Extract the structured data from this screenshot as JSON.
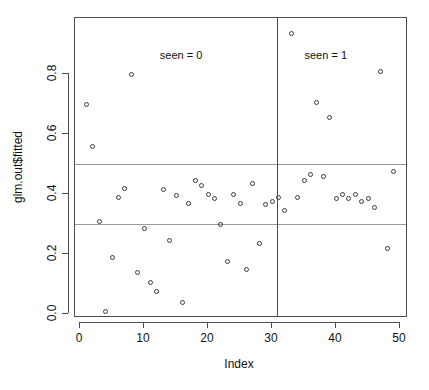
{
  "chart_data": {
    "type": "scatter",
    "title": "",
    "xlabel": "Index",
    "ylabel": "glm.out$fitted",
    "xlim": [
      0,
      50
    ],
    "ylim": [
      0.0,
      0.95
    ],
    "xticks": [
      0,
      10,
      20,
      30,
      40,
      50
    ],
    "yticks": [
      0.0,
      0.2,
      0.4,
      0.6,
      0.8
    ],
    "ytick_labels": [
      "0.0",
      "0.2",
      "0.4",
      "0.6",
      "0.8"
    ],
    "xtick_labels": [
      "0",
      "10",
      "20",
      "30",
      "40",
      "50"
    ],
    "grid": false,
    "legend": "none",
    "point_style": "open-circle",
    "annotations": [
      {
        "text": "seen = 0",
        "x": 15.8,
        "y": 0.885
      },
      {
        "text": "seen = 1",
        "x": 38.4,
        "y": 0.885
      }
    ],
    "hlines": [
      0.5,
      0.3
    ],
    "vlines": [
      30.8
    ],
    "series": [
      {
        "name": "glm.out$fitted",
        "x": [
          1,
          2,
          3,
          4,
          5,
          6,
          7,
          8,
          9,
          10,
          11,
          12,
          13,
          14,
          15,
          16,
          17,
          18,
          19,
          20,
          21,
          22,
          23,
          24,
          25,
          26,
          27,
          28,
          29,
          30,
          31,
          32,
          33,
          34,
          35,
          36,
          37,
          38,
          39,
          40,
          41,
          42,
          43,
          44,
          45,
          46,
          47,
          48,
          49
        ],
        "y": [
          0.7,
          0.56,
          0.31,
          0.01,
          0.19,
          0.39,
          0.42,
          0.8,
          0.14,
          0.285,
          0.105,
          0.075,
          0.415,
          0.245,
          0.395,
          0.04,
          0.37,
          0.445,
          0.43,
          0.4,
          0.385,
          0.3,
          0.175,
          0.4,
          0.37,
          0.15,
          0.435,
          0.235,
          0.365,
          0.375,
          0.39,
          0.345,
          0.935,
          0.39,
          0.445,
          0.465,
          0.705,
          0.46,
          0.655,
          0.385,
          0.4,
          0.385,
          0.4,
          0.375,
          0.385,
          0.355,
          0.81,
          0.22,
          0.475
        ]
      }
    ]
  },
  "axes": {
    "x_title": "Index",
    "y_title": "glm.out$fitted"
  }
}
